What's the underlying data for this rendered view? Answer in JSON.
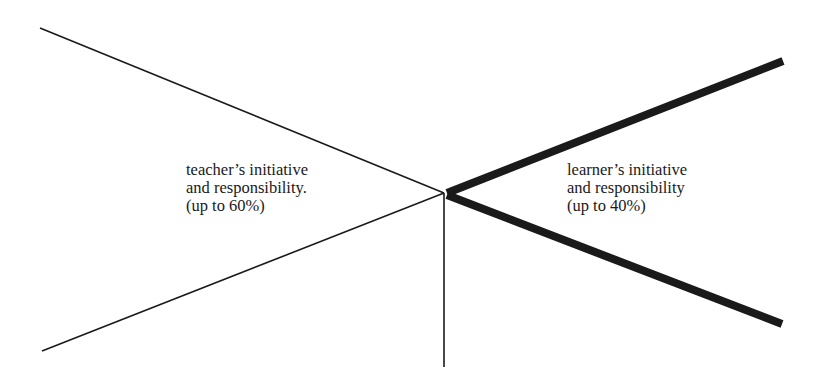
{
  "diagram": {
    "colors": {
      "background": "#ffffff",
      "line": "#1a1a1a"
    },
    "center": {
      "x": 444,
      "y": 193
    },
    "lines": [
      {
        "name": "teacher-upper-line",
        "x1": 40,
        "y1": 28,
        "x2": 444,
        "y2": 193,
        "width": 1.6
      },
      {
        "name": "teacher-lower-line",
        "x1": 42,
        "y1": 351,
        "x2": 444,
        "y2": 193,
        "width": 1.6
      },
      {
        "name": "vertical-divider-line",
        "x1": 444,
        "y1": 193,
        "x2": 444,
        "y2": 367,
        "width": 1.6
      },
      {
        "name": "learner-upper-line",
        "x1": 447,
        "y1": 193,
        "x2": 783,
        "y2": 61,
        "width": 8
      },
      {
        "name": "learner-lower-line",
        "x1": 447,
        "y1": 195,
        "x2": 782,
        "y2": 324,
        "width": 8
      }
    ],
    "teacher": {
      "line1": "teacher’s initiative",
      "line2": "and responsibility.",
      "line3": "(up to 60%)"
    },
    "learner": {
      "line1": "learner’s initiative",
      "line2": "and responsibility",
      "line3": "(up to 40%)"
    }
  }
}
